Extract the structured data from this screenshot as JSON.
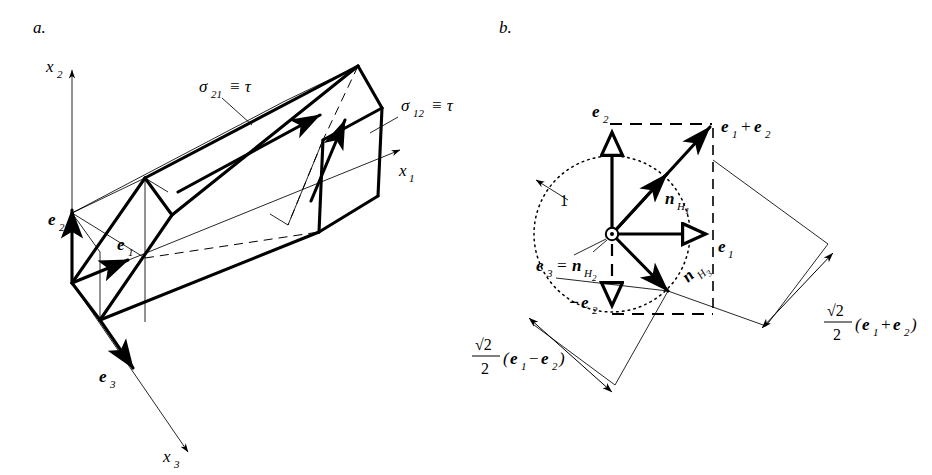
{
  "figure": {
    "panels": [
      {
        "id": "a",
        "letter": "a.",
        "description": "rectangular prism with shear stress arrows and coordinate axes",
        "labels": {
          "axis_x2": "x",
          "axis_x2_sub": "2",
          "axis_x1": "x",
          "axis_x1_sub": "1",
          "axis_x3": "x",
          "axis_x3_sub": "3",
          "basis_e1": "e",
          "basis_e1_sub": "1",
          "basis_e2": "e",
          "basis_e2_sub": "2",
          "basis_e3": "e",
          "basis_e3_sub": "3",
          "stress_21_sigma": "σ",
          "stress_21_sub": "21",
          "stress_21_rest": "≡ τ",
          "stress_12_sigma": "σ",
          "stress_12_sub": "12",
          "stress_12_rest": "≡ τ"
        }
      },
      {
        "id": "b",
        "letter": "b.",
        "description": "unit circle with basis vectors, normals to habit planes and rotated squares",
        "labels": {
          "e2": "e",
          "e2_sub": "2",
          "e1": "e",
          "e1_sub": "1",
          "minus_e2_sign": "−",
          "minus_e2": "e",
          "minus_e2_sub": "2",
          "e1_plus_e2_first": "e",
          "e1_plus_e2_first_sub": "1",
          "e1_plus_e2_op": "+",
          "e1_plus_e2_second": "e",
          "e1_plus_e2_second_sub": "2",
          "n_H1": "n",
          "n_H1_sub": "H",
          "n_H1_subsub": "1",
          "n_H3": "n",
          "n_H3_sub": "H",
          "n_H3_subsub": "3",
          "e3_eq_nH2_e": "e",
          "e3_eq_nH2_e_sub": "3",
          "e3_eq_nH2_eq": "=",
          "e3_eq_nH2_n": "n",
          "e3_eq_nH2_n_sub": "H",
          "e3_eq_nH2_n_subsub": "2",
          "radius": "1",
          "frac_numerator": "√2",
          "frac_denominator": "2",
          "dim_plus_open": "(",
          "dim_plus_e1": "e",
          "dim_plus_e1_sub": "1",
          "dim_plus_op": "+",
          "dim_plus_e2": "e",
          "dim_plus_e2_sub": "2",
          "dim_plus_close": ")",
          "dim_minus_open": "(",
          "dim_minus_e1": "e",
          "dim_minus_e1_sub": "1",
          "dim_minus_op": "−",
          "dim_minus_e2": "e",
          "dim_minus_e2_sub": "2",
          "dim_minus_close": ")"
        }
      }
    ],
    "colors": {
      "ink": "#000000",
      "background": "#ffffff"
    }
  }
}
